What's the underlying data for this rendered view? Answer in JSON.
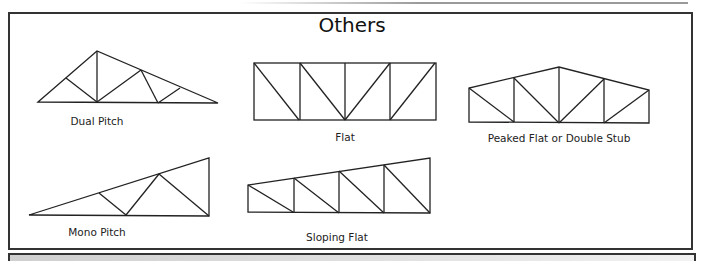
{
  "title": "Others",
  "trusses": [
    {
      "id": "dual-pitch",
      "label": "Dual Pitch"
    },
    {
      "id": "flat",
      "label": "Flat"
    },
    {
      "id": "peaked-flat",
      "label": "Peaked Flat or Double Stub"
    },
    {
      "id": "mono-pitch",
      "label": "Mono Pitch"
    },
    {
      "id": "sloping-flat",
      "label": "Sloping Flat"
    }
  ],
  "colors": {
    "line": "#222222",
    "frame": "#333333",
    "bottom_bar": "#d9d9d9"
  }
}
